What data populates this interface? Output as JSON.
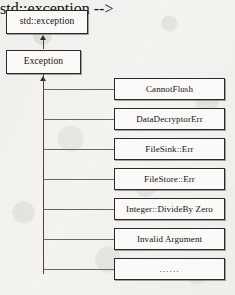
{
  "diagram": {
    "type": "class-inheritance-hierarchy",
    "root": {
      "label": "std::exception"
    },
    "base": {
      "label": "Exception"
    },
    "derived": [
      {
        "label": "CannotFlush"
      },
      {
        "label": "DataDecryptorErr"
      },
      {
        "label": "FileSink::Err"
      },
      {
        "label": "FileStore::Err"
      },
      {
        "label": "Integer::DivideBy Zero"
      },
      {
        "label": "Invalid Argument"
      },
      {
        "label": "......"
      }
    ],
    "colors": {
      "background": "#f3f2ef",
      "box_fill": "#fbfaf8",
      "box_border": "#2b2b2b",
      "connector": "#55524d",
      "text": "#141414"
    }
  }
}
